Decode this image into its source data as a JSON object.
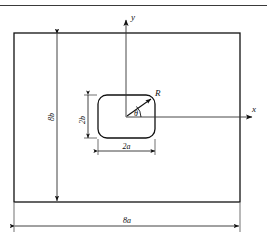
{
  "figure": {
    "title_ghost": "",
    "kind": "engineering-dimension-diagram",
    "labels": {
      "y_axis": "y",
      "x_axis": "x",
      "corner_radius": "R",
      "angle": "θ",
      "inner_height": "2b",
      "inner_width": "2a",
      "outer_height": "8b",
      "outer_width": "8a"
    },
    "colors": {
      "line": "#111111",
      "thin_line": "#333333",
      "background": "#ffffff",
      "header_rule": "#3a3a3a"
    },
    "geometry": {
      "outer_rect": {
        "x": 14,
        "y": 33,
        "width": 226,
        "height": 169
      },
      "inner_rect": {
        "x": 98,
        "y": 95,
        "width": 57,
        "height": 43,
        "corner_radius": 9
      },
      "origin": {
        "x": 126,
        "y": 117
      },
      "y_axis_top": 14,
      "x_axis_right": 258,
      "dim_8b_x": 57,
      "dim_8a_y": 226,
      "dim_2b_x": 88,
      "dim_2a_y": 150
    }
  }
}
